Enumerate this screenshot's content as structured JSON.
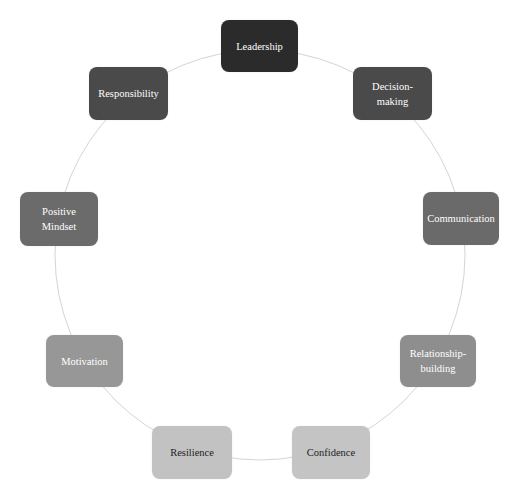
{
  "diagram": {
    "type": "cycle",
    "ring_color": "#d4d4d4",
    "center": [
      260,
      255
    ],
    "radius": 205,
    "nodes": [
      {
        "label": "Leadership",
        "x": 221,
        "y": 20,
        "w": 77,
        "h": 52,
        "fill": "#2b2b2b",
        "text": "#ffffff"
      },
      {
        "label": "Decision-\nmaking",
        "x": 353,
        "y": 67,
        "w": 79,
        "h": 53,
        "fill": "#4a4a4a",
        "text": "#ffffff"
      },
      {
        "label": "Communication",
        "x": 423,
        "y": 192,
        "w": 76,
        "h": 53,
        "fill": "#6a6a6a",
        "text": "#ffffff"
      },
      {
        "label": "Relationship-\nbuilding",
        "x": 400,
        "y": 335,
        "w": 76,
        "h": 52,
        "fill": "#8e8e8e",
        "text": "#ffffff"
      },
      {
        "label": "Confidence",
        "x": 292,
        "y": 426,
        "w": 78,
        "h": 53,
        "fill": "#c4c4c4",
        "text": "#222222"
      },
      {
        "label": "Resilience",
        "x": 152,
        "y": 426,
        "w": 80,
        "h": 53,
        "fill": "#c2c2c2",
        "text": "#222222"
      },
      {
        "label": "Motivation",
        "x": 46,
        "y": 335,
        "w": 77,
        "h": 52,
        "fill": "#979797",
        "text": "#ffffff"
      },
      {
        "label": "Positive\nMindset",
        "x": 20,
        "y": 192,
        "w": 78,
        "h": 54,
        "fill": "#6b6b6b",
        "text": "#ffffff"
      },
      {
        "label": "Responsibility",
        "x": 89,
        "y": 67,
        "w": 79,
        "h": 53,
        "fill": "#4a4a4a",
        "text": "#ffffff"
      }
    ]
  }
}
